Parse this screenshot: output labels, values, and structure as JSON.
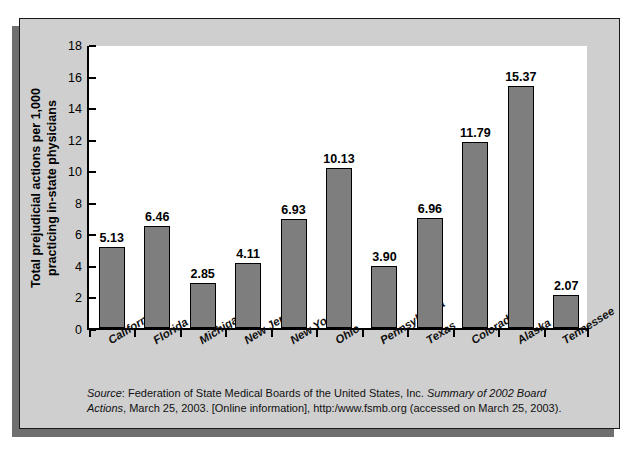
{
  "chart_data": {
    "type": "bar",
    "title": "",
    "xlabel": "",
    "ylabel": "Total prejudicial actions per 1,000 practicing in-state physicians",
    "ylabel_line1": "Total prejudicial actions per 1,000",
    "ylabel_line2": "practicing in-state physicians",
    "ylim": [
      0,
      18
    ],
    "ytick_step": 2,
    "yticks": [
      "18",
      "16",
      "14",
      "12",
      "10",
      "8",
      "6",
      "4",
      "2",
      "0"
    ],
    "grid": false,
    "legend": "none",
    "categories": [
      "California",
      "Florida",
      "Michigan",
      "New Jersey",
      "New York",
      "Ohio",
      "Pennsylvania",
      "Texas",
      "Colorado",
      "Alaska",
      "Tennessee"
    ],
    "values": [
      5.13,
      6.46,
      2.85,
      4.11,
      6.93,
      10.13,
      3.9,
      6.96,
      11.79,
      15.37,
      2.07
    ],
    "value_labels": [
      "5.13",
      "6.46",
      "2.85",
      "4.11",
      "6.93",
      "10.13",
      "3.90",
      "6.96",
      "11.79",
      "15.37",
      "2.07"
    ],
    "bar_color": "#7e7e7e",
    "bar_edge_color": "#000000",
    "plot_background": "#ffffff",
    "panel_background": "#cfcfcf"
  },
  "source_note": {
    "label": "Source",
    "label_suffix": ": ",
    "text_part1": "Federation of State Medical Boards of the United States, Inc. ",
    "italic_title": "Summary of 2002 Board Actions",
    "text_part2": ", March 25, 2003. [Online information], http:/www.fsmb.org (accessed on March 25, 2003)."
  }
}
